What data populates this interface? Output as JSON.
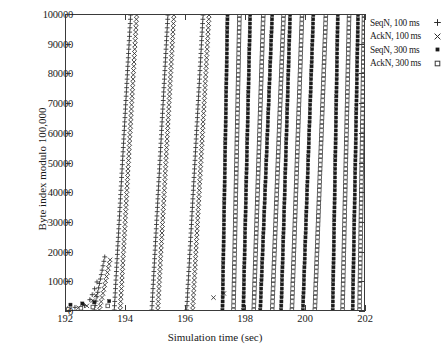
{
  "figure": {
    "xlabel": "Simulation time (sec)",
    "ylabel": "Byte index modulo 100,000"
  },
  "axes": {
    "x_ticks": [
      "192",
      "194",
      "196",
      "198",
      "200",
      "202"
    ],
    "y_ticks": [
      "0",
      "10000",
      "20000",
      "30000",
      "40000",
      "50000",
      "60000",
      "70000",
      "80000",
      "90000",
      "100000"
    ]
  },
  "legend": {
    "items": [
      {
        "label": "SeqN, 100 ms",
        "marker": "plus-icon",
        "color": "#2b2b2b"
      },
      {
        "label": "AckN, 100 ms",
        "marker": "cross-icon",
        "color": "#2b2b2b"
      },
      {
        "label": "SeqN, 300 ms",
        "marker": "filled-square-icon",
        "color": "#1a1a1a"
      },
      {
        "label": "AckN, 300 ms",
        "marker": "open-square-icon",
        "color": "#4a4a4a"
      }
    ]
  },
  "chart_data": {
    "type": "scatter",
    "title": "",
    "xlabel": "Simulation time (sec)",
    "ylabel": "Byte index modulo 100,000",
    "xlim": [
      192,
      202
    ],
    "ylim": [
      0,
      100000
    ],
    "xticks": [
      192,
      194,
      196,
      198,
      200,
      202
    ],
    "yticks": [
      0,
      10000,
      20000,
      30000,
      40000,
      50000,
      60000,
      70000,
      80000,
      90000,
      100000
    ],
    "grid": false,
    "legend_position": "outside-top-right",
    "series": [
      {
        "name": "SeqN, 100 ms",
        "marker": "plus",
        "color": "#2b2b2b",
        "ramps": [
          {
            "x0": 193.62,
            "x1": 194.17,
            "y0": 0,
            "y1": 100000
          },
          {
            "x0": 194.88,
            "x1": 195.42,
            "y0": 0,
            "y1": 100000
          },
          {
            "x0": 196.05,
            "x1": 196.6,
            "y0": 0,
            "y1": 100000
          },
          {
            "x0": 192.95,
            "x1": 193.3,
            "y0": 0,
            "y1": 18000
          }
        ],
        "slow_start_points": [
          {
            "x": 192.05,
            "y": 400
          },
          {
            "x": 192.3,
            "y": 900
          },
          {
            "x": 192.62,
            "y": 1500
          },
          {
            "x": 192.8,
            "y": 3500
          },
          {
            "x": 192.88,
            "y": 5200
          },
          {
            "x": 192.96,
            "y": 7200
          },
          {
            "x": 193.04,
            "y": 9500
          }
        ]
      },
      {
        "name": "AckN, 100 ms",
        "marker": "cross",
        "color": "#2b2b2b",
        "ramps": [
          {
            "x0": 193.82,
            "x1": 194.37,
            "y0": 0,
            "y1": 100000
          },
          {
            "x0": 195.08,
            "x1": 195.62,
            "y0": 0,
            "y1": 100000
          },
          {
            "x0": 196.25,
            "x1": 196.8,
            "y0": 0,
            "y1": 100000
          },
          {
            "x0": 193.12,
            "x1": 193.48,
            "y0": 0,
            "y1": 17000
          }
        ],
        "slow_start_points": [
          {
            "x": 192.12,
            "y": 300
          },
          {
            "x": 192.42,
            "y": 800
          },
          {
            "x": 192.7,
            "y": 1400
          },
          {
            "x": 192.9,
            "y": 3200
          },
          {
            "x": 193.0,
            "y": 5000
          },
          {
            "x": 196.95,
            "y": 4200
          },
          {
            "x": 197.3,
            "y": 5600
          }
        ]
      },
      {
        "name": "SeqN, 300 ms",
        "marker": "filled-square",
        "color": "#1a1a1a",
        "ramps": [
          {
            "x0": 197.25,
            "x1": 197.42,
            "y0": 0,
            "y1": 100000
          },
          {
            "x0": 197.95,
            "x1": 198.18,
            "y0": 0,
            "y1": 100000
          },
          {
            "x0": 198.52,
            "x1": 198.92,
            "y0": 0,
            "y1": 100000
          },
          {
            "x0": 199.22,
            "x1": 199.52,
            "y0": 0,
            "y1": 100000
          },
          {
            "x0": 199.95,
            "x1": 200.3,
            "y0": 0,
            "y1": 100000
          },
          {
            "x0": 200.95,
            "x1": 201.12,
            "y0": 0,
            "y1": 100000
          },
          {
            "x0": 201.62,
            "x1": 201.8,
            "y0": 0,
            "y1": 100000
          }
        ],
        "slow_start_points": [
          {
            "x": 192.15,
            "y": 1800
          },
          {
            "x": 192.55,
            "y": 2200
          },
          {
            "x": 192.95,
            "y": 2600
          },
          {
            "x": 193.45,
            "y": 3000
          }
        ]
      },
      {
        "name": "AckN, 300 ms",
        "marker": "open-square",
        "color": "#4a4a4a",
        "ramps": [
          {
            "x0": 197.62,
            "x1": 197.82,
            "y0": 0,
            "y1": 100000
          },
          {
            "x0": 198.3,
            "x1": 198.62,
            "y0": 0,
            "y1": 100000
          },
          {
            "x0": 198.92,
            "x1": 199.3,
            "y0": 0,
            "y1": 100000
          },
          {
            "x0": 199.58,
            "x1": 199.92,
            "y0": 0,
            "y1": 100000
          },
          {
            "x0": 200.35,
            "x1": 200.72,
            "y0": 0,
            "y1": 100000
          },
          {
            "x0": 201.28,
            "x1": 201.5,
            "y0": 0,
            "y1": 100000
          },
          {
            "x0": 201.85,
            "x1": 202.0,
            "y0": 0,
            "y1": 100000
          }
        ],
        "slow_start_points": [
          {
            "x": 192.08,
            "y": 200
          },
          {
            "x": 192.5,
            "y": 600
          },
          {
            "x": 192.9,
            "y": 1000
          },
          {
            "x": 193.4,
            "y": 1400
          }
        ]
      }
    ]
  }
}
